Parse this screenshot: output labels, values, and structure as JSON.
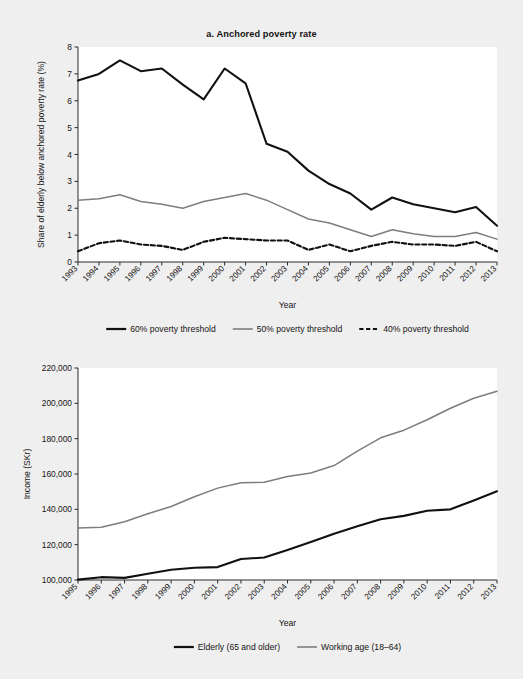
{
  "figure": {
    "background_color": "#f0efef",
    "plot_background_color": "#ffffff",
    "panel_a_title": "a. Anchored poverty rate",
    "panel_b_title": "b. Median disposable income"
  },
  "colors": {
    "black_series": "#111111",
    "gray_series": "#7d7d7d",
    "axis": "#2b2b2b",
    "text": "#141414"
  },
  "chart_data": [
    {
      "type": "line",
      "title": "a. Anchored poverty rate",
      "xlabel": "Year",
      "ylabel": "Share of elderly below anchored poverty rate (%)",
      "ylim": [
        0,
        8
      ],
      "yticks": [
        0,
        1,
        2,
        3,
        4,
        5,
        6,
        7,
        8
      ],
      "ytick_labels": [
        "0",
        "1",
        "2",
        "3",
        "4",
        "5",
        "6",
        "7",
        "8"
      ],
      "grid": false,
      "legend_position": "below",
      "categories": [
        "1993",
        "1994",
        "1995",
        "1996",
        "1997",
        "1998",
        "1999",
        "2000",
        "2001",
        "2002",
        "2003",
        "2004",
        "2005",
        "2006",
        "2007",
        "2008",
        "2009",
        "2010",
        "2011",
        "2012",
        "2013"
      ],
      "series": [
        {
          "name": "60% poverty threshold",
          "style": "solid",
          "color": "#111111",
          "width": 2.1,
          "values": [
            6.75,
            7.0,
            7.5,
            7.1,
            7.2,
            6.6,
            6.05,
            7.2,
            6.65,
            4.4,
            4.1,
            3.4,
            2.9,
            2.55,
            1.95,
            2.4,
            2.15,
            2.0,
            1.85,
            2.05,
            1.35
          ]
        },
        {
          "name": "50% poverty threshold",
          "style": "solid",
          "color": "#7d7d7d",
          "width": 1.5,
          "values": [
            2.3,
            2.35,
            2.5,
            2.25,
            2.15,
            2.0,
            2.25,
            2.4,
            2.55,
            2.3,
            1.95,
            1.6,
            1.45,
            1.2,
            0.95,
            1.2,
            1.05,
            0.95,
            0.95,
            1.1,
            0.85
          ]
        },
        {
          "name": "40% poverty threshold",
          "style": "dashed",
          "color": "#111111",
          "width": 2.1,
          "values": [
            0.4,
            0.7,
            0.8,
            0.65,
            0.6,
            0.45,
            0.75,
            0.9,
            0.85,
            0.8,
            0.8,
            0.45,
            0.65,
            0.4,
            0.6,
            0.75,
            0.65,
            0.65,
            0.6,
            0.75,
            0.4
          ]
        }
      ],
      "legend": [
        {
          "label": "60% poverty threshold",
          "style": "solid",
          "color": "#111111"
        },
        {
          "label": "50% poverty threshold",
          "style": "solid",
          "color": "#7d7d7d"
        },
        {
          "label": "40% poverty threshold",
          "style": "dashed",
          "color": "#111111"
        }
      ]
    },
    {
      "type": "line",
      "title": "b. Median disposable income",
      "xlabel": "Year",
      "ylabel": "Income (SKr)",
      "ylim": [
        100000,
        220000
      ],
      "yticks": [
        100000,
        120000,
        140000,
        160000,
        180000,
        200000,
        220000
      ],
      "ytick_labels": [
        "100,000",
        "120,000",
        "140,000",
        "160,000",
        "180,000",
        "200,000",
        "220,000"
      ],
      "grid": false,
      "legend_position": "below",
      "categories": [
        "1995",
        "1996",
        "1997",
        "1998",
        "1999",
        "2000",
        "2001",
        "2002",
        "2003",
        "2004",
        "2005",
        "2006",
        "2007",
        "2008",
        "2009",
        "2010",
        "2011",
        "2012",
        "2013"
      ],
      "series": [
        {
          "name": "Elderly (65 and older)",
          "style": "solid",
          "color": "#111111",
          "width": 2.1,
          "values": [
            100200,
            101600,
            101200,
            103500,
            105800,
            106900,
            107300,
            111900,
            112700,
            117000,
            121500,
            126200,
            130400,
            134400,
            136300,
            139200,
            140000,
            145000,
            150200
          ]
        },
        {
          "name": "Working age (18–64)",
          "style": "solid",
          "color": "#7d7d7d",
          "width": 1.5,
          "values": [
            129400,
            129900,
            133000,
            137500,
            141600,
            147100,
            152000,
            155100,
            155300,
            158600,
            160600,
            164800,
            173000,
            180500,
            184800,
            190700,
            197200,
            202900,
            206800
          ]
        }
      ],
      "legend": [
        {
          "label": "Elderly (65 and older)",
          "style": "solid",
          "color": "#111111"
        },
        {
          "label": "Working age (18–64)",
          "style": "solid",
          "color": "#7d7d7d"
        }
      ]
    }
  ]
}
